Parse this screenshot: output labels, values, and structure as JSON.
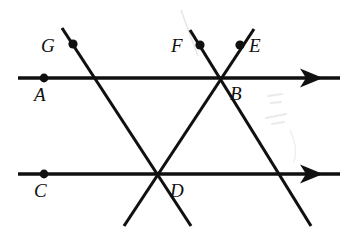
{
  "figure": {
    "type": "geometry-diagram",
    "width": 353,
    "height": 233,
    "background_color": "#ffffff",
    "stroke_color": "#101010"
  },
  "labels": {
    "A": "A",
    "B": "B",
    "C": "C",
    "D": "D",
    "E": "E",
    "F": "F",
    "G": "G"
  },
  "label_positions": [
    {
      "key": "A",
      "text": "A",
      "x": 34,
      "y": 85
    },
    {
      "key": "B",
      "text": "B",
      "x": 230,
      "y": 84
    },
    {
      "key": "C",
      "text": "C",
      "x": 34,
      "y": 181
    },
    {
      "key": "D",
      "text": "D",
      "x": 170,
      "y": 181
    },
    {
      "key": "E",
      "text": "E",
      "x": 249,
      "y": 36
    },
    {
      "key": "F",
      "text": "F",
      "x": 171,
      "y": 36
    },
    {
      "key": "G",
      "text": "G",
      "x": 41,
      "y": 36
    }
  ],
  "dots": [
    {
      "name": "point-a-dot",
      "x": 44,
      "y": 78,
      "r": 4.4
    },
    {
      "name": "point-c-dot",
      "x": 44,
      "y": 174,
      "r": 4.4
    },
    {
      "name": "point-g-dot",
      "x": 73,
      "y": 44,
      "r": 4.6
    },
    {
      "name": "point-f-dot",
      "x": 200,
      "y": 45,
      "r": 4.6
    },
    {
      "name": "point-e-dot",
      "x": 240,
      "y": 45,
      "r": 4.6
    }
  ],
  "rays": [
    {
      "name": "upper-parallel-ray",
      "x1": 18,
      "y1": 78,
      "x2": 340,
      "y2": 78,
      "arrow_at": {
        "x": 318,
        "y": 78
      }
    },
    {
      "name": "lower-parallel-ray",
      "x1": 18,
      "y1": 174,
      "x2": 340,
      "y2": 174,
      "arrow_at": {
        "x": 318,
        "y": 174
      }
    }
  ],
  "transversals": [
    {
      "name": "line-g-through-d",
      "x1": 62,
      "y1": 28,
      "x2": 191,
      "y2": 226
    },
    {
      "name": "line-f-through-b",
      "x1": 190,
      "y1": 30,
      "x2": 311,
      "y2": 226
    },
    {
      "name": "line-e-through-b-and-d",
      "x1": 254,
      "y1": 29,
      "x2": 124,
      "y2": 226
    }
  ],
  "intersections": [
    {
      "name": "intersection-b",
      "x": 218,
      "y": 78
    },
    {
      "name": "intersection-d",
      "x": 158,
      "y": 174
    }
  ],
  "artifacts": [
    {
      "name": "scan-smudge-upper",
      "x": 176,
      "y": 8,
      "w": 22,
      "h": 52
    },
    {
      "name": "scan-smudge-right",
      "x": 262,
      "y": 92,
      "w": 48,
      "h": 48
    }
  ]
}
